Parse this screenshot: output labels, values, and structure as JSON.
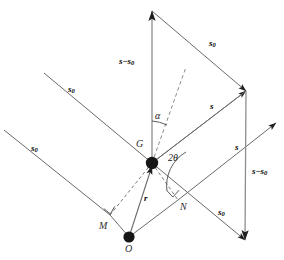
{
  "figure": {
    "background_color": "#ffffff",
    "line_color": "#555555",
    "dot_color": "#1a1a1a",
    "width": 284,
    "height": 260,
    "labels": {
      "s_vector": "s",
      "s0_vector": "s",
      "s0_subscript": "0",
      "s_minus_s0": "s",
      "s_minus_s0_minus": "−",
      "s_minus_s0_tail": "s",
      "s_minus_s0_tail_sub": "0",
      "r_vector": "r",
      "point_G": "G",
      "point_O": "O",
      "point_M": "M",
      "point_N": "N",
      "angle_alpha": "α",
      "angle_two_theta": "2θ"
    },
    "annotations": [
      {
        "name": "s0-incident-upper-left",
        "text": "s",
        "sub": "0",
        "x": 68,
        "y": 85
      },
      {
        "name": "s0-incident-lower-left",
        "text": "s",
        "sub": "0",
        "x": 31,
        "y": 144
      },
      {
        "name": "s0-top-right",
        "text": "s",
        "sub": "0",
        "x": 209,
        "y": 39
      },
      {
        "name": "s0-bottom-right",
        "text": "s",
        "sub": "0",
        "x": 218,
        "y": 208
      },
      {
        "name": "s-scattered-upper",
        "text": "s",
        "sub": "",
        "x": 209,
        "y": 102
      },
      {
        "name": "s-scattered-lower",
        "text": "s",
        "sub": "",
        "x": 234,
        "y": 143
      },
      {
        "name": "s-minus-s0-left",
        "text": "s−s",
        "sub": "0",
        "x": 119,
        "y": 57
      },
      {
        "name": "s-minus-s0-right",
        "text": "s−s",
        "sub": "0",
        "x": 252,
        "y": 167
      },
      {
        "name": "r-vector",
        "text": "r",
        "sub": "",
        "x": 143,
        "y": 194
      },
      {
        "name": "point-G",
        "text": "G",
        "x": 136,
        "y": 140
      },
      {
        "name": "point-O",
        "text": "O",
        "x": 125,
        "y": 245
      },
      {
        "name": "point-M",
        "text": "M",
        "x": 99,
        "y": 222
      },
      {
        "name": "point-N",
        "text": "N",
        "x": 180,
        "y": 203
      },
      {
        "name": "angle-alpha",
        "text": "α",
        "x": 155,
        "y": 112
      },
      {
        "name": "angle-2theta",
        "text": "2θ",
        "x": 168,
        "y": 154
      }
    ],
    "points": [
      {
        "name": "center-of-gravity-G",
        "x": 152,
        "y": 163,
        "r": 6.2
      },
      {
        "name": "origin-O",
        "x": 129,
        "y": 237,
        "r": 5.6
      }
    ],
    "geometry": {
      "apex_top": [
        152,
        11
      ],
      "vertex_right": [
        246,
        91
      ],
      "vertex_bottom_right": [
        245,
        240
      ],
      "diag_arrow_right": [
        276,
        123
      ],
      "incident_upper_left_start": [
        44,
        73
      ],
      "incident_lower_left_start": [
        4,
        130
      ],
      "foot_M": [
        110,
        215
      ],
      "foot_N": [
        178,
        200
      ],
      "dashed_alpha_end": [
        186,
        67
      ]
    }
  }
}
